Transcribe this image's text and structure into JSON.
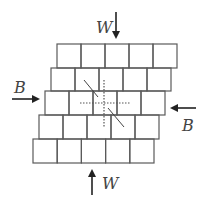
{
  "diagram": {
    "title": "",
    "rows": [
      {
        "x": 57,
        "y": 44,
        "w": 120,
        "h": 24,
        "blocks": 5
      },
      {
        "x": 51,
        "y": 68,
        "w": 120,
        "h": 23,
        "blocks": 5
      },
      {
        "x": 45,
        "y": 91,
        "w": 120,
        "h": 24,
        "blocks": 5
      },
      {
        "x": 39,
        "y": 115,
        "w": 120,
        "h": 24,
        "blocks": 5
      },
      {
        "x": 33,
        "y": 139,
        "w": 121,
        "h": 24,
        "blocks": 5
      }
    ],
    "forces": {
      "top": {
        "label": "W",
        "direction": "down"
      },
      "bottom": {
        "label": "W",
        "direction": "up"
      },
      "left": {
        "label": "B",
        "direction": "right"
      },
      "right": {
        "label": "B",
        "direction": "left"
      }
    },
    "colors": {
      "line": "#5a5a5a",
      "arrow": "#222222",
      "text": "#444444",
      "dotted": "#555555"
    }
  }
}
